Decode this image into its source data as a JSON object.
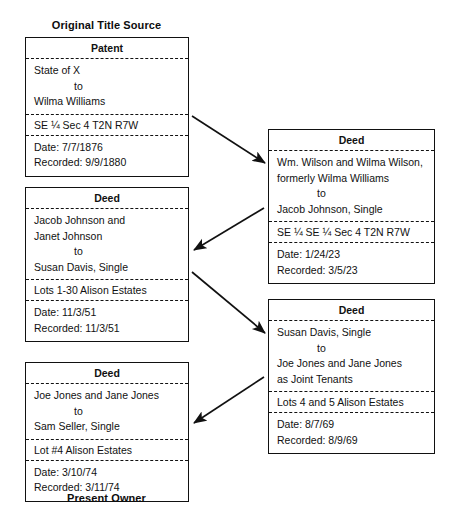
{
  "diagram": {
    "top_caption": "Original Title Source",
    "bottom_caption": "Present Owner",
    "boxes": [
      {
        "id": "patent",
        "title": "Patent",
        "grantor": "State of X",
        "connector": "to",
        "grantee": "Wilma Williams",
        "legal_description": "SE  ¼ Sec 4 T2N R7W",
        "date_label": "Date: 7/7/1876",
        "recorded_label": "Recorded: 9/9/1880"
      },
      {
        "id": "deed-1",
        "title": "Deed",
        "grantor": "Wm. Wilson and Wilma Wilson,",
        "grantor_line2": "formerly Wilma Williams",
        "connector": "to",
        "grantee": "Jacob Johnson, Single",
        "legal_description": "SE ¼ SE ¼ Sec 4 T2N R7W",
        "date_label": "Date: 1/24/23",
        "recorded_label": "Recorded: 3/5/23"
      },
      {
        "id": "deed-2",
        "title": "Deed",
        "grantor": "Jacob Johnson and",
        "grantor_line2": "Janet Johnson",
        "connector": "to",
        "grantee": "Susan Davis, Single",
        "legal_description": "Lots 1-30 Alison Estates",
        "date_label": "Date: 11/3/51",
        "recorded_label": "Recorded: 11/3/51"
      },
      {
        "id": "deed-3",
        "title": "Deed",
        "grantor": "Susan Davis, Single",
        "connector": "to",
        "grantee": "Joe Jones and Jane Jones",
        "grantee_line2": "as Joint Tenants",
        "legal_description": "Lots 4 and 5 Alison Estates",
        "date_label": "Date: 8/7/69",
        "recorded_label": "Recorded: 8/9/69"
      },
      {
        "id": "deed-4",
        "title": "Deed",
        "grantor": "Joe Jones and Jane Jones",
        "connector": "to",
        "grantee": "Sam Seller, Single",
        "legal_description": "Lot #4 Alison Estates",
        "date_label": "Date: 3/10/74",
        "recorded_label": "Recorded: 3/11/74"
      }
    ],
    "colors": {
      "line": "#111111",
      "background": "#ffffff",
      "text": "#111111"
    }
  }
}
